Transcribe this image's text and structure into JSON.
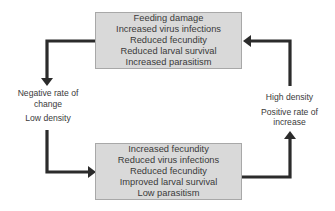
{
  "diagram": {
    "top_box": {
      "lines": [
        "Feeding damage",
        "Increased virus infections",
        "Reduced fecundity",
        "Reduced larval survival",
        "Increased parasitism"
      ]
    },
    "bottom_box": {
      "lines": [
        "Increased fecundity",
        "Reduced virus infections",
        "Reduced fecundity",
        "Improved larval survival",
        "Low parasitism"
      ]
    },
    "left_label": {
      "rate_line1": "Negative rate of",
      "rate_line2": "change",
      "density": "Low density"
    },
    "right_label": {
      "density": "High density",
      "rate_line1": "Positive rate of",
      "rate_line2": "increase"
    },
    "colors": {
      "box_fill": "#d9d9d9",
      "box_border": "#a8a8a8",
      "arrow": "#2b2b2b",
      "text": "#3a3a3a"
    }
  }
}
